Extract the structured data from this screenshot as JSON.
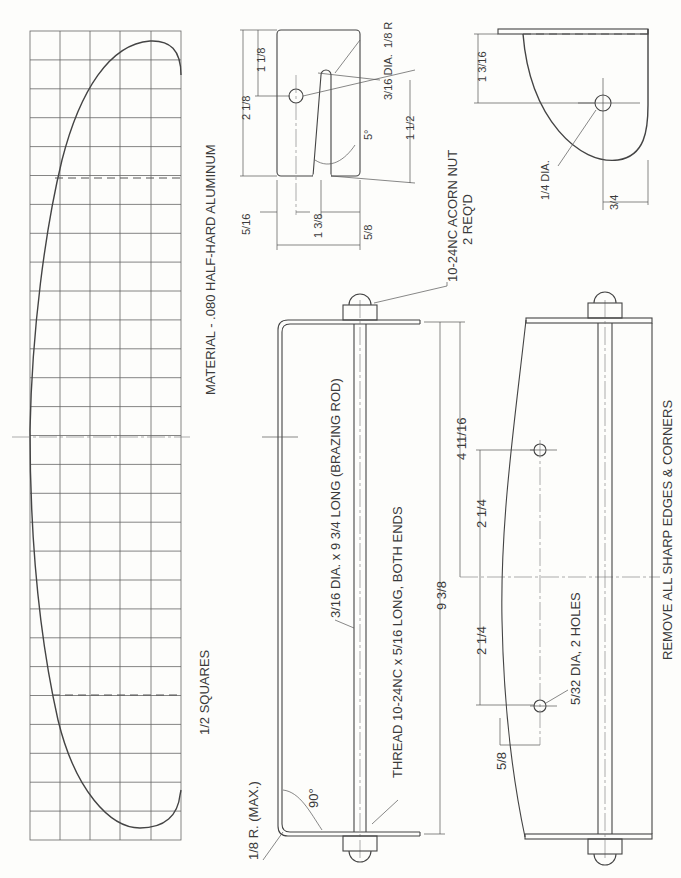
{
  "drawing": {
    "notes": {
      "material": "MATERIAL - .080 HALF-HARD ALUMINUM",
      "grid_scale": "1/2 SQUARES",
      "remove_edges": "REMOVE ALL SHARP EDGES & CORNERS",
      "acorn_nut_line1": "10-24NC ACORN NUT",
      "acorn_nut_line2": "2 REQ'D",
      "rod": "3/16 DIA. x 9 3/4 LONG (BRAZING ROD)",
      "thread": "THREAD 10-24NC x 5/16 LONG, BOTH ENDS",
      "bend_radius": "1/8 R. (MAX.)",
      "bend_angle": "90°",
      "small_holes": "5/32 DIA, 2 HOLES"
    },
    "slot_plate": {
      "overall_height": "2 1/8",
      "hole_offset": "1 1/8",
      "slot_radius": "1/8 R",
      "hole_dia": "3/16 DIA.",
      "slot_angle": "5°",
      "slot_length": "1 1/2",
      "left_offset": "5/16",
      "width": "1 3/8",
      "right_offset": "5/8"
    },
    "end_plate": {
      "hole_offset": "1 3/16",
      "hole_dia": "1/4 DIA.",
      "bottom_offset": "3/4"
    },
    "assembly": {
      "overall_length": "9 3/8",
      "half_length": "4 11/16",
      "hole_spacing_upper": "2 1/4",
      "hole_spacing_lower": "2 1/4",
      "edge_offset": "5/8"
    },
    "grid": {
      "columns": 5,
      "rows": 28
    }
  }
}
